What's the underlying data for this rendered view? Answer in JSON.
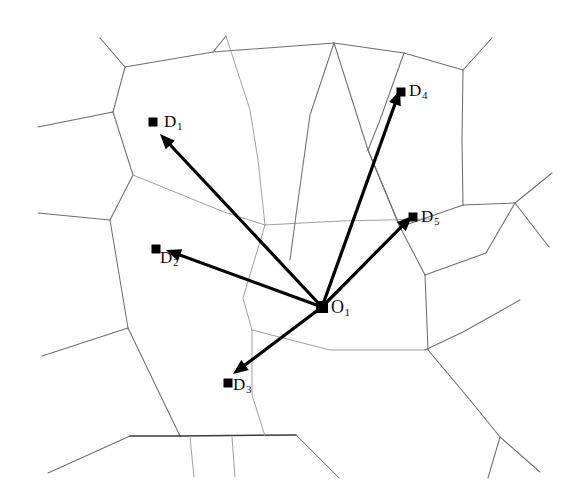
{
  "figure": {
    "kind": "voronoi-vector-diagram",
    "caption": "",
    "background_color": "#ffffff",
    "edge_color": "#6e6e72",
    "vector_color": "#000000",
    "marker_color": "#000000",
    "width": 580,
    "height": 499
  },
  "origin": {
    "id": "O1",
    "label": "O",
    "subscript": "1",
    "x": 322,
    "y": 307
  },
  "destinations": [
    {
      "id": "D1",
      "label": "D",
      "subscript": "1",
      "x": 153,
      "y": 122,
      "label_x": 164,
      "label_y": 113
    },
    {
      "id": "D2",
      "label": "D",
      "subscript": "2",
      "x": 156,
      "y": 249,
      "label_x": 160,
      "label_y": 249
    },
    {
      "id": "D3",
      "label": "D",
      "subscript": "3",
      "x": 228,
      "y": 383,
      "label_x": 233,
      "label_y": 376
    },
    {
      "id": "D4",
      "label": "D",
      "subscript": "4",
      "x": 401,
      "y": 92,
      "label_x": 409,
      "label_y": 82
    },
    {
      "id": "D5",
      "label": "D",
      "subscript": "5",
      "x": 413,
      "y": 217,
      "label_x": 421,
      "label_y": 208
    }
  ],
  "vectors": [
    {
      "id": "vector-O1-D1",
      "from": "O1",
      "to": "D1",
      "tip_x": 160,
      "tip_y": 134
    },
    {
      "id": "vector-O1-D2",
      "from": "O1",
      "to": "D2",
      "tip_x": 166,
      "tip_y": 250
    },
    {
      "id": "vector-O1-D3",
      "from": "O1",
      "to": "D3",
      "tip_x": 233,
      "tip_y": 374
    },
    {
      "id": "vector-O1-D4",
      "from": "O1",
      "to": "D4",
      "tip_x": 400,
      "tip_y": 90
    },
    {
      "id": "vector-O1-D5",
      "from": "O1",
      "to": "D5",
      "tip_x": 412,
      "tip_y": 216
    }
  ],
  "cell_edges": [
    {
      "id": "edge-top-left-spur",
      "weight": "normal",
      "points": "100,38 125,67"
    },
    {
      "id": "edge-top-ridge",
      "weight": "normal",
      "points": "125,67 213,52 334,43"
    },
    {
      "id": "edge-top-mid-spur",
      "weight": "normal",
      "points": "213,52 226,36"
    },
    {
      "id": "edge-top-right-ridge",
      "weight": "normal",
      "points": "334,43 404,53 463,70"
    },
    {
      "id": "edge-top-right-spur",
      "weight": "normal",
      "points": "463,70 492,38"
    },
    {
      "id": "edge-left-upper",
      "weight": "normal",
      "points": "125,67 113,112"
    },
    {
      "id": "edge-left-upper-arm",
      "weight": "normal",
      "points": "113,112 38,127"
    },
    {
      "id": "edge-left-mid",
      "weight": "normal",
      "points": "113,112 133,175 110,220"
    },
    {
      "id": "edge-left-mid-arm",
      "weight": "normal",
      "points": "110,220 38,213"
    },
    {
      "id": "edge-left-lower",
      "weight": "normal",
      "points": "110,220 128,328"
    },
    {
      "id": "edge-left-lower-arm",
      "weight": "normal",
      "points": "128,328 42,356"
    },
    {
      "id": "edge-left-bottom",
      "weight": "normal",
      "points": "128,328 180,436"
    },
    {
      "id": "edge-bottom-left-arm",
      "weight": "strong",
      "points": "180,436 130,436"
    },
    {
      "id": "edge-bottom-left-tail",
      "weight": "normal",
      "points": "130,436 48,473"
    },
    {
      "id": "edge-bottom-ridge",
      "weight": "strong",
      "points": "180,436 296,435"
    },
    {
      "id": "edge-bottom-spur-a",
      "weight": "faint",
      "points": "190,437 194,477"
    },
    {
      "id": "edge-bottom-spur-b",
      "weight": "faint",
      "points": "232,437 235,477"
    },
    {
      "id": "edge-bottom-right-tail",
      "weight": "normal",
      "points": "296,435 339,478"
    },
    {
      "id": "edge-cell1-bottom",
      "weight": "faint",
      "points": "133,175 224,212 265,225"
    },
    {
      "id": "edge-cell-mid-vert",
      "weight": "faint",
      "points": "265,225 258,160 250,110 226,36"
    },
    {
      "id": "edge-mid-down",
      "weight": "faint",
      "points": "265,225 243,298 252,330"
    },
    {
      "id": "edge-mid-horizontal",
      "weight": "faint",
      "points": "265,225 340,221 430,219"
    },
    {
      "id": "edge-center-lower",
      "weight": "faint",
      "points": "252,330 252,395 265,436"
    },
    {
      "id": "edge-center-lower-right",
      "weight": "faint",
      "points": "252,330 330,350 425,350"
    },
    {
      "id": "edge-right-upper-v",
      "weight": "normal",
      "points": "334,43 310,115 296,215 290,260"
    },
    {
      "id": "edge-right-upper-v2",
      "weight": "normal",
      "points": "334,43 368,150 400,227 425,275"
    },
    {
      "id": "edge-right-box-top",
      "weight": "normal",
      "points": "463,70 462,140 463,205"
    },
    {
      "id": "edge-right-cross-nw",
      "weight": "normal",
      "points": "463,205 515,203"
    },
    {
      "id": "edge-right-cross-ne",
      "weight": "normal",
      "points": "515,203 552,173"
    },
    {
      "id": "edge-right-cross-se",
      "weight": "normal",
      "points": "515,203 549,247"
    },
    {
      "id": "edge-right-cross-sw",
      "weight": "normal",
      "points": "515,203 486,253 425,275"
    },
    {
      "id": "edge-mid-right-stem",
      "weight": "normal",
      "points": "425,275 428,350"
    },
    {
      "id": "edge-mid-right-down",
      "weight": "normal",
      "points": "428,350 470,400 500,437"
    },
    {
      "id": "edge-right-down-fork",
      "weight": "normal",
      "points": "500,437 540,472"
    },
    {
      "id": "edge-right-down-fork2",
      "weight": "normal",
      "points": "500,437 488,478"
    },
    {
      "id": "edge-right-lower-arm",
      "weight": "normal",
      "points": "425,350 463,332 520,300"
    },
    {
      "id": "edge-right-box-left",
      "weight": "normal",
      "points": "404,53 380,120 368,150"
    },
    {
      "id": "edge-right-box-bot",
      "weight": "normal",
      "points": "368,150 400,227 463,205"
    }
  ]
}
